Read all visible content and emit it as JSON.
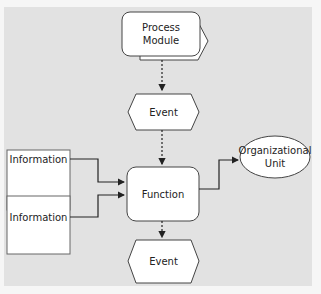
{
  "diagram": {
    "type": "EPC (Event-driven Process Chain)",
    "nodes": [
      {
        "id": "process_module",
        "shape": "process-path",
        "label": "Process Module"
      },
      {
        "id": "event_top",
        "shape": "hexagon",
        "label": "Event"
      },
      {
        "id": "information_1",
        "shape": "rectangle",
        "label": "Information"
      },
      {
        "id": "information_2",
        "shape": "rectangle",
        "label": "Information"
      },
      {
        "id": "function",
        "shape": "rounded-rectangle",
        "label": "Function"
      },
      {
        "id": "org_unit",
        "shape": "ellipse",
        "label": "Organizational Unit"
      },
      {
        "id": "event_bottom",
        "shape": "hexagon",
        "label": "Event"
      }
    ],
    "edges": [
      {
        "from": "process_module",
        "to": "event_top",
        "style": "dashed"
      },
      {
        "from": "event_top",
        "to": "function",
        "style": "dashed"
      },
      {
        "from": "information_1",
        "to": "function",
        "style": "solid"
      },
      {
        "from": "information_2",
        "to": "function",
        "style": "solid"
      },
      {
        "from": "function",
        "to": "org_unit",
        "style": "solid"
      },
      {
        "from": "function",
        "to": "event_bottom",
        "style": "dashed"
      }
    ]
  },
  "labels": {
    "process_module_line1": "Process",
    "process_module_line2": "Module",
    "event_top": "Event",
    "information_1": "Information",
    "information_2": "Information",
    "function": "Function",
    "org_unit_line1": "Organizational",
    "org_unit_line2": "Unit",
    "event_bottom": "Event"
  },
  "colors": {
    "background": "#e2e2e2",
    "shape_fill": "#ffffff",
    "stroke": "#222222"
  }
}
